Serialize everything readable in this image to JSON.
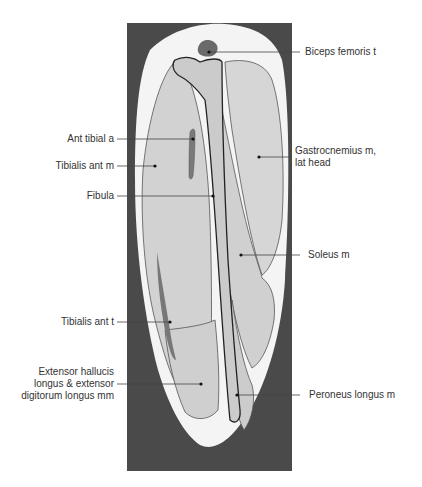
{
  "figure": {
    "colors": {
      "background_panel": "#4a4a4a",
      "skin_fat": "#f4f4f4",
      "muscle": "#cfcfcf",
      "muscle_light": "#d9d9d9",
      "bone": "#c8c8c8",
      "tendon_dark": "#7a7a7a",
      "outline": "#555555",
      "bone_outline": "#222222",
      "leader": "#444444",
      "text": "#333333"
    }
  },
  "labels": {
    "left": [
      {
        "id": "ant-tibial-a",
        "text": "Ant tibial a"
      },
      {
        "id": "tibialis-ant-m",
        "text": "Tibialis ant m"
      },
      {
        "id": "fibula",
        "text": "Fibula"
      },
      {
        "id": "tibialis-ant-t",
        "text": "Tibialis ant t"
      },
      {
        "id": "extensor",
        "text": "Extensor hallucis longus & extensor digitorum longus mm",
        "lines": [
          "Extensor hallucis",
          "longus & extensor",
          "digitorum longus mm"
        ]
      }
    ],
    "right": [
      {
        "id": "biceps-femoris-t",
        "text": "Biceps femoris t"
      },
      {
        "id": "gastrocnemius",
        "text": "Gastrocnemius m, lat head",
        "lines": [
          "Gastrocnemius m,",
          "lat head"
        ]
      },
      {
        "id": "soleus-m",
        "text": "Soleus m"
      },
      {
        "id": "peroneus-longus-m",
        "text": "Peroneus longus m"
      }
    ]
  }
}
